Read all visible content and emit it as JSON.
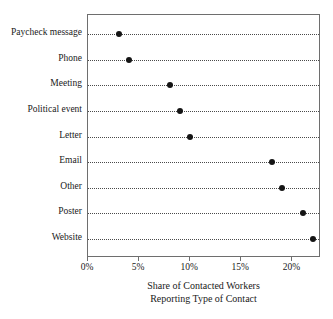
{
  "chart_data": {
    "type": "scatter",
    "orientation": "horizontal",
    "title": "",
    "subtitle": "",
    "xlabel_lines": [
      "Share of Contacted Workers",
      "Reporting Type of Contact"
    ],
    "ylabel": "",
    "categories": [
      "Paycheck message",
      "Phone",
      "Meeting",
      "Political event",
      "Letter",
      "Email",
      "Other",
      "Poster",
      "Website"
    ],
    "values": [
      3,
      4,
      8,
      9,
      10,
      18,
      19,
      21,
      22
    ],
    "value_unit": "%",
    "xlim": [
      0,
      22.8
    ],
    "xticks": [
      0,
      5,
      10,
      15,
      20
    ],
    "xtick_labels": [
      "0%",
      "5%",
      "10%",
      "15%",
      "20%"
    ],
    "grid": "dotted-leader-lines-per-category",
    "legend": "none",
    "marker": "filled-circle",
    "marker_color": "#141414",
    "frame_color": "#6e6e6e",
    "background_color": "#ffffff"
  }
}
